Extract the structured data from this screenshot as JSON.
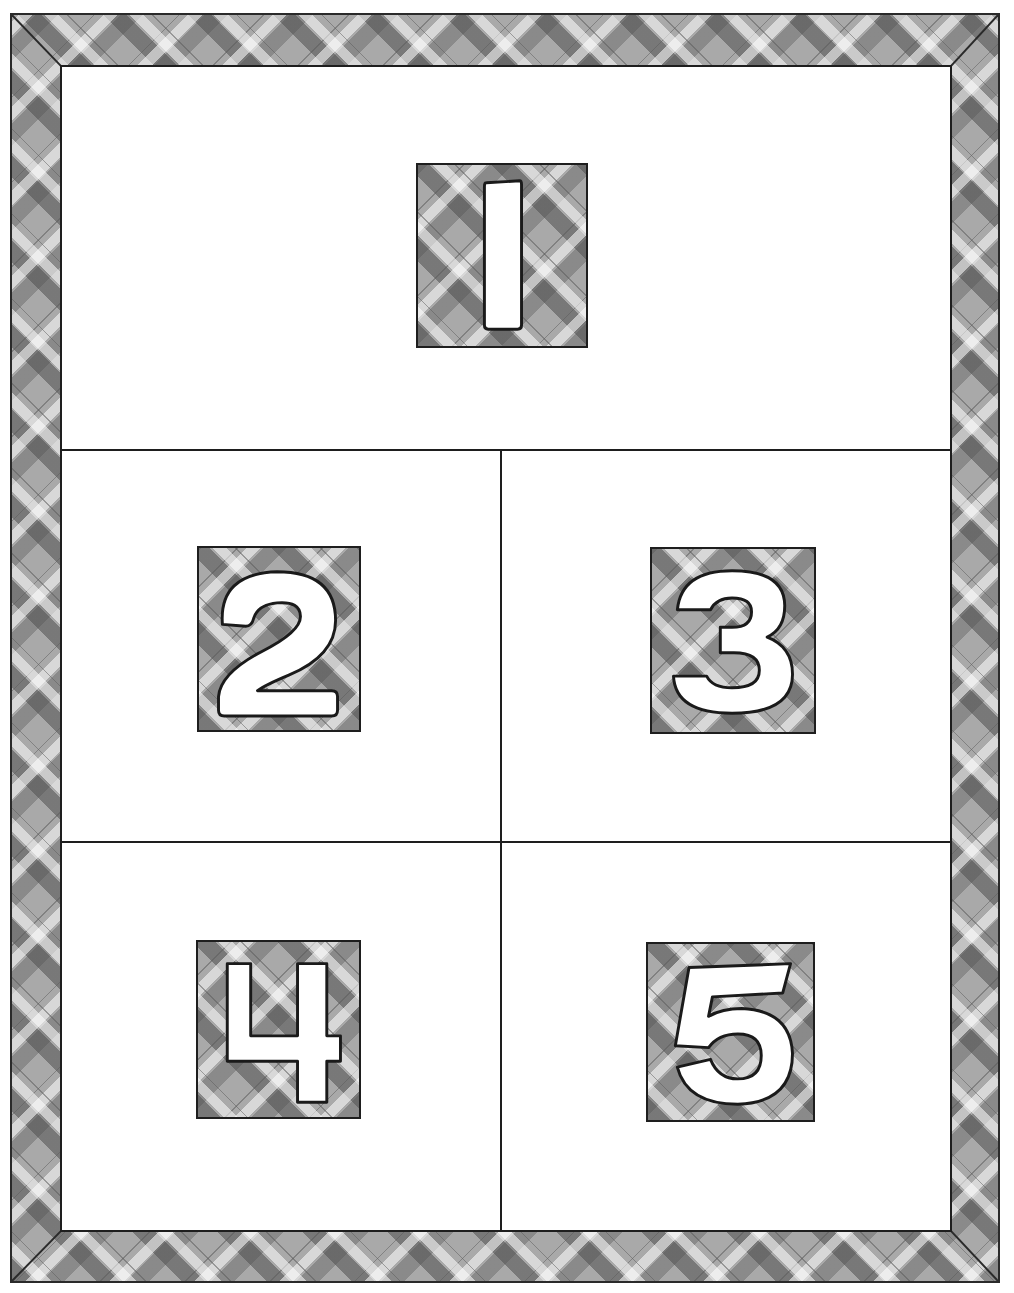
{
  "board": {
    "title": "Number board 1-5",
    "colors": {
      "frame_plaid_base": "#a9a9a9",
      "plaid_dark": "#6e6e6e",
      "plaid_light": "#e6e6e6",
      "outline": "#1e1e1e",
      "background": "#ffffff"
    },
    "sections": [
      {
        "id": "section-1",
        "number": "1",
        "label": "1"
      },
      {
        "id": "section-2",
        "number": "2",
        "label": "2"
      },
      {
        "id": "section-3",
        "number": "3",
        "label": "3"
      },
      {
        "id": "section-4",
        "number": "4",
        "label": "4"
      },
      {
        "id": "section-5",
        "number": "5",
        "label": "5"
      }
    ]
  }
}
